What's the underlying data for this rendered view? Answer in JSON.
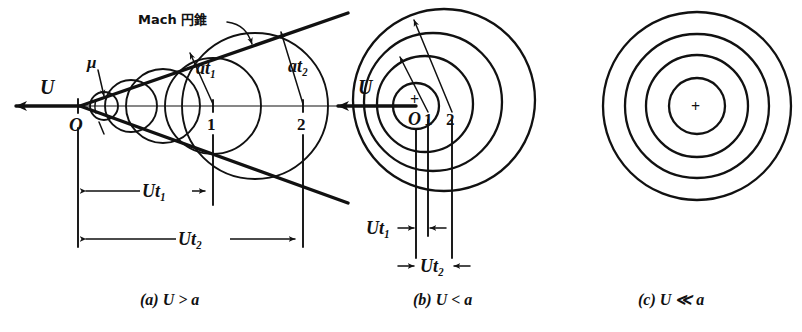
{
  "figure": {
    "title_note": "Mach cone and spherical sound-wave diagram",
    "annotation": {
      "mach_cone_label": "Mach 円錐",
      "mu_label": "μ"
    },
    "panels": [
      {
        "id": "a",
        "caption": "(a)  U > a",
        "caption_parts": {
          "tag": "(a)",
          "relation": "U > a"
        },
        "labels": {
          "velocity": "U",
          "origin": "O",
          "point1": "1",
          "point2": "2",
          "radius1": "at₁",
          "radius2": "at₂",
          "dim1": "Ut₁",
          "dim2": "Ut₂",
          "angle": "μ"
        },
        "wavefront_count": 4,
        "description": "Supersonic: wave circles fall behind, forming a Mach cone of half-angle mu."
      },
      {
        "id": "b",
        "caption": "(b)  U < a",
        "caption_parts": {
          "tag": "(b)",
          "relation": "U < a"
        },
        "labels": {
          "velocity": "U",
          "origin": "O",
          "point1": "1",
          "point2": "2",
          "dim1": "Ut₁",
          "dim2": "Ut₂",
          "center_marker": "+"
        },
        "wavefront_count": 4,
        "description": "Subsonic: circles nested but off-centre, no cone."
      },
      {
        "id": "c",
        "caption": "(c)  U ≪ a",
        "caption_parts": {
          "tag": "(c)",
          "relation": "U ≪ a"
        },
        "labels": {
          "center_marker": "+"
        },
        "wavefront_count": 4,
        "description": "Nearly stationary source: concentric circles."
      }
    ],
    "colors": {
      "ink": "#111111",
      "paper": "#ffffff"
    }
  }
}
